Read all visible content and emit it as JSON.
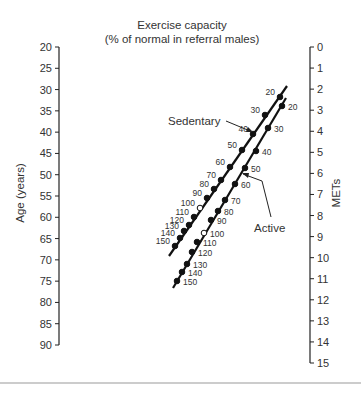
{
  "title": {
    "line1": "Exercise capacity",
    "line2": "(% of normal in referral males)"
  },
  "left_axis": {
    "label": "Age (years)",
    "ticks": [
      "20",
      "25",
      "30",
      "35",
      "40",
      "45",
      "50",
      "55",
      "60",
      "65",
      "70",
      "75",
      "80",
      "85",
      "90"
    ]
  },
  "right_axis": {
    "label": "METs",
    "ticks": [
      "0",
      "1",
      "2",
      "3",
      "4",
      "5",
      "6",
      "7",
      "8",
      "9",
      "10",
      "11",
      "12",
      "13",
      "14",
      "15"
    ]
  },
  "series_labels": {
    "sedentary": "Sedentary",
    "active": "Active"
  },
  "chart_data": {
    "type": "nomogram",
    "title": "Exercise capacity (% of normal in referral males)",
    "left_axis": {
      "label": "Age (years)",
      "range": [
        20,
        90
      ],
      "step": 5
    },
    "right_axis": {
      "label": "METs",
      "range": [
        0,
        15
      ],
      "step": 1
    },
    "series": [
      {
        "name": "Sedentary",
        "scale_labels": [
          "20",
          "30",
          "40",
          "50",
          "60",
          "70",
          "80",
          "90",
          "100",
          "110",
          "120",
          "130",
          "140",
          "150"
        ],
        "open_marker": "100",
        "points": [
          [
            280,
            97
          ],
          [
            265,
            115
          ],
          [
            253,
            134
          ],
          [
            242,
            150
          ],
          [
            230,
            167
          ],
          [
            221,
            180
          ],
          [
            214,
            189
          ],
          [
            207,
            198
          ],
          [
            200,
            208
          ],
          [
            194,
            217
          ],
          [
            189,
            225
          ],
          [
            184,
            231
          ],
          [
            180,
            238
          ],
          [
            175,
            246
          ]
        ],
        "line": [
          [
            287,
            86
          ],
          [
            169,
            256
          ]
        ]
      },
      {
        "name": "Active",
        "scale_labels": [
          "20",
          "30",
          "40",
          "50",
          "60",
          "70",
          "80",
          "90",
          "100",
          "110",
          "120",
          "130",
          "140",
          "150"
        ],
        "open_marker": "100",
        "points": [
          [
            282,
            106
          ],
          [
            268,
            128
          ],
          [
            256,
            151
          ],
          [
            245,
            168
          ],
          [
            235,
            184
          ],
          [
            225,
            200
          ],
          [
            218,
            211
          ],
          [
            211,
            220
          ],
          [
            204,
            233
          ],
          [
            197,
            242
          ],
          [
            192,
            252
          ],
          [
            187,
            264
          ],
          [
            182,
            272
          ],
          [
            177,
            281
          ]
        ],
        "line": [
          [
            286,
            98
          ],
          [
            173,
            288
          ]
        ]
      }
    ]
  }
}
